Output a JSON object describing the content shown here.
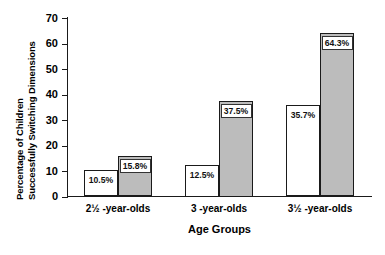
{
  "chart_data": {
    "type": "bar",
    "title": "",
    "xlabel": "Age Groups",
    "ylabel_line1": "Percentage of Children",
    "ylabel_line2": "Successfully Switching Dimensions",
    "categories": [
      "2½ -year-olds",
      "3 -year-olds",
      "3½ -year-olds"
    ],
    "ylim": [
      0,
      70
    ],
    "yticks": [
      0,
      10,
      20,
      30,
      40,
      50,
      60,
      70
    ],
    "ytick_labels": [
      "0",
      "10",
      "20",
      "30",
      "40",
      "50",
      "60",
      "70"
    ],
    "grid": false,
    "legend": "none",
    "series": [
      {
        "name": "open",
        "fill": "#ffffff",
        "values": [
          10.5,
          12.5,
          35.7
        ],
        "labels": [
          "10.5%",
          "12.5%",
          "35.7%"
        ]
      },
      {
        "name": "filled",
        "fill": "#bcbcbc",
        "values": [
          15.8,
          37.5,
          64.3
        ],
        "labels": [
          "15.8%",
          "37.5%",
          "64.3%"
        ]
      }
    ]
  },
  "colors": {
    "axis": "#1a1a1a",
    "bar_open": "#ffffff",
    "bar_filled": "#bcbcbc",
    "background": "#ffffff"
  }
}
